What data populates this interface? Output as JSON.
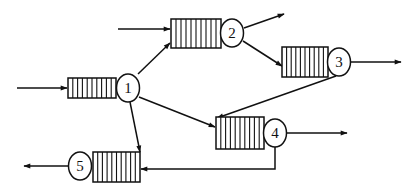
{
  "diagram": {
    "type": "queueing-network",
    "colors": {
      "stroke": "#111111",
      "background": "#ffffff"
    },
    "nodes": [
      {
        "id": "1",
        "label": "1"
      },
      {
        "id": "2",
        "label": "2"
      },
      {
        "id": "3",
        "label": "3"
      },
      {
        "id": "4",
        "label": "4"
      },
      {
        "id": "5",
        "label": "5"
      }
    ],
    "edges": [
      {
        "from": "external",
        "to": "1",
        "kind": "arrival"
      },
      {
        "from": "external",
        "to": "2",
        "kind": "arrival"
      },
      {
        "from": "1",
        "to": "2",
        "kind": "routing"
      },
      {
        "from": "1",
        "to": "4",
        "kind": "routing"
      },
      {
        "from": "1",
        "to": "5",
        "kind": "routing"
      },
      {
        "from": "2",
        "to": "external",
        "kind": "departure"
      },
      {
        "from": "2",
        "to": "3",
        "kind": "routing"
      },
      {
        "from": "3",
        "to": "external",
        "kind": "departure"
      },
      {
        "from": "3",
        "to": "4",
        "kind": "routing"
      },
      {
        "from": "4",
        "to": "external",
        "kind": "departure"
      },
      {
        "from": "4",
        "to": "5",
        "kind": "routing"
      },
      {
        "from": "5",
        "to": "external",
        "kind": "departure"
      }
    ]
  }
}
